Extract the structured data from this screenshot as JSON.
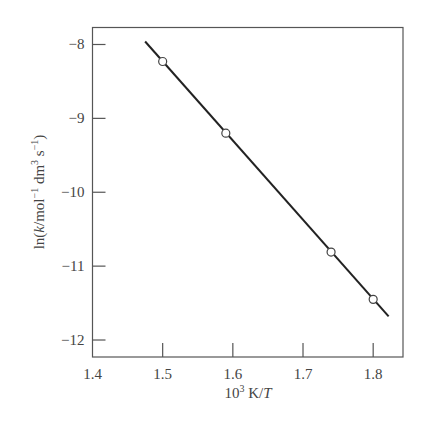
{
  "chart_data": {
    "type": "scatter",
    "title": "",
    "xlabel": "10³ K/T",
    "ylabel": "ln(k/mol⁻¹ dm³ s⁻¹)",
    "xlim": [
      1.4,
      1.8425
    ],
    "ylim": [
      -12.23,
      -7.77
    ],
    "xticks": [
      1.4,
      1.5,
      1.6,
      1.7,
      1.8
    ],
    "xtick_labels": [
      "1.4",
      "1.5",
      "1.6",
      "1.7",
      "1.8"
    ],
    "yticks": [
      -8,
      -9,
      -10,
      -11,
      -12
    ],
    "ytick_labels": [
      "−8",
      "−9",
      "−10",
      "−11",
      "−12"
    ],
    "grid": false,
    "legend": null,
    "series": [
      {
        "name": "data points",
        "marker": "open-circle",
        "x": [
          1.5,
          1.59,
          1.74,
          1.8
        ],
        "y": [
          -8.23,
          -9.2,
          -10.81,
          -11.45
        ]
      },
      {
        "name": "fit line",
        "style": "solid-line",
        "x": [
          1.475,
          1.822
        ],
        "y": [
          -7.96,
          -11.68
        ]
      }
    ]
  }
}
